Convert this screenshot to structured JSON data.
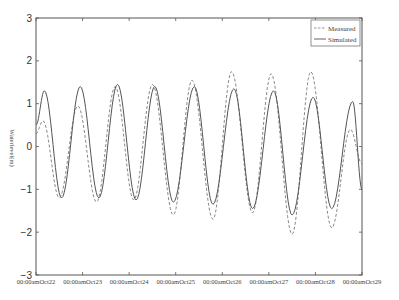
{
  "chart_data": {
    "type": "line",
    "title": "",
    "xlabel": "",
    "ylabel": "Waterlevel(m)",
    "ylim": [
      -3,
      3
    ],
    "yticks": [
      -3,
      -2,
      -1,
      0,
      1,
      2,
      3
    ],
    "xlim": [
      0,
      7
    ],
    "xtick_labels": [
      "00:00amOct22",
      "00:00amOct23",
      "00:00amOct24",
      "00:00amOct25",
      "00:00amOct26",
      "00:00amOct27",
      "00:00amOct28",
      "00:00amOct29"
    ],
    "grid": false,
    "legend_position": "upper right",
    "series": [
      {
        "name": "Measured",
        "style": "dashed",
        "color": "#888888",
        "extrema_days": [
          0.0,
          0.15,
          0.5,
          0.9,
          1.3,
          1.7,
          2.1,
          2.5,
          2.95,
          3.35,
          3.8,
          4.2,
          4.65,
          5.05,
          5.5,
          5.9,
          6.35,
          6.75,
          7.0
        ],
        "extrema_values": [
          0.3,
          0.6,
          -1.2,
          0.95,
          -1.3,
          1.4,
          -1.25,
          1.45,
          -1.6,
          1.55,
          -1.7,
          1.75,
          -1.55,
          1.7,
          -2.05,
          1.75,
          -1.9,
          0.4,
          -0.4
        ]
      },
      {
        "name": "Simulated",
        "style": "solid",
        "color": "#555555",
        "extrema_days": [
          0.0,
          0.18,
          0.55,
          0.95,
          1.35,
          1.75,
          2.15,
          2.55,
          2.95,
          3.4,
          3.8,
          4.25,
          4.65,
          5.1,
          5.5,
          5.95,
          6.35,
          6.8,
          7.0
        ],
        "extrema_values": [
          0.5,
          1.3,
          -1.2,
          1.4,
          -1.2,
          1.45,
          -1.25,
          1.4,
          -1.3,
          1.4,
          -1.35,
          1.35,
          -1.45,
          1.3,
          -1.6,
          1.15,
          -1.45,
          1.05,
          -1.0
        ]
      }
    ]
  },
  "legend": {
    "items": [
      {
        "label": "Measured",
        "style": "dashed"
      },
      {
        "label": "Simulated",
        "style": "solid"
      }
    ]
  },
  "colors": {
    "axis": "#555555",
    "measured": "#8a8a8a",
    "simulated": "#555555"
  }
}
